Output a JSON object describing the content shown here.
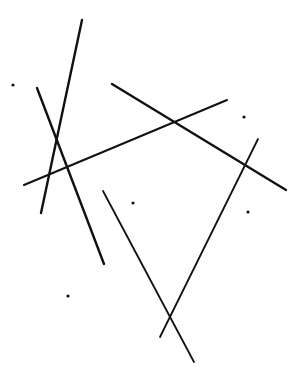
{
  "figure": {
    "width": 303,
    "height": 377,
    "background": "#ffffff",
    "stroke_color": "#111111",
    "dot_color": "#111111"
  },
  "lines": [
    {
      "id": "line-1",
      "x1": 82,
      "y1": 20,
      "x2": 41,
      "y2": 213,
      "width": 2.4
    },
    {
      "id": "line-2",
      "x1": 37,
      "y1": 88,
      "x2": 104,
      "y2": 264,
      "width": 2.4
    },
    {
      "id": "line-3",
      "x1": 24,
      "y1": 185,
      "x2": 227,
      "y2": 100,
      "width": 2.0
    },
    {
      "id": "line-4",
      "x1": 112,
      "y1": 84,
      "x2": 286,
      "y2": 190,
      "width": 2.4
    },
    {
      "id": "line-5",
      "x1": 258,
      "y1": 139,
      "x2": 160,
      "y2": 337,
      "width": 1.8
    },
    {
      "id": "line-6",
      "x1": 103,
      "y1": 191,
      "x2": 194,
      "y2": 362,
      "width": 1.8
    }
  ],
  "dots": [
    {
      "id": "dot-1",
      "cx": 13,
      "cy": 85,
      "r": 1.6
    },
    {
      "id": "dot-2",
      "cx": 244,
      "cy": 117,
      "r": 1.6
    },
    {
      "id": "dot-3",
      "cx": 133,
      "cy": 203,
      "r": 1.6
    },
    {
      "id": "dot-4",
      "cx": 248,
      "cy": 212,
      "r": 1.6
    },
    {
      "id": "dot-5",
      "cx": 68,
      "cy": 296,
      "r": 1.6
    }
  ]
}
